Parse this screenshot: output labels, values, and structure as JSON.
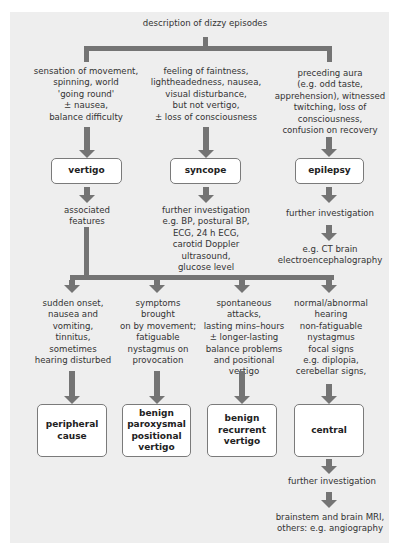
{
  "title": "description of dizzy episodes",
  "level1": [
    {
      "description": "sensation of movement,\nspinning, world\n'going round'\n± nausea,\nbalance difficulty",
      "diagnosis": "vertigo",
      "next": "associated\nfeatures"
    },
    {
      "description": "feeling of faintness,\nlightheadedness, nausea,\nvisual disturbance,\nbut not vertigo,\n± loss of consciousness",
      "diagnosis": "syncope",
      "next": "further investigation\ne.g. BP, postural BP,\nECG, 24 h ECG,\ncarotid Doppler\nultrasound,\nglucose level"
    },
    {
      "description": "preceding aura\n(e.g. odd taste,\napprehension), witnessed\ntwitching, loss of\nconsciousness,\nconfusion on recovery",
      "diagnosis": "epilepsy",
      "next": "further investigation",
      "next2": "e.g. CT brain\nelectroencephalography"
    }
  ],
  "vertigo_branches": [
    {
      "features": "sudden onset,\nnausea  and\nvomiting,\ntinnitus,\nsometimes\nhearing disturbed",
      "diagnosis": "peripheral\ncause"
    },
    {
      "features": "symptoms\nbrought\non by movement;\nfatiguable\nnystagmus on\nprovocation",
      "diagnosis": "benign\nparoxysmal\npositional\nvertigo"
    },
    {
      "features": "spontaneous attacks,\nlasting mins–hours\n± longer-lasting\nbalance problems\nand positional\nvertigo",
      "diagnosis": "benign\nrecurrent\nvertigo"
    },
    {
      "features": "normal/abnormal\nhearing\nnon-fatiguable\nnystagmus\nfocal signs\ne.g. diplopia,\ncerebellar signs,",
      "diagnosis": "central",
      "next": "further investigation",
      "next2": "brainstem and brain MRI,\nothers: e.g. angiography"
    }
  ],
  "colors": {
    "panel": "#eeeeee",
    "connector": "#747474",
    "box_border": "#7a7a7a"
  }
}
